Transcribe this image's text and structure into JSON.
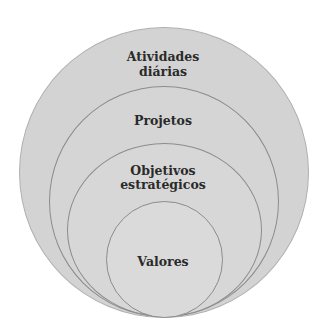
{
  "diagram": {
    "type": "nested-circles",
    "colors": {
      "fill": "#d4d4d4",
      "stroke": "#8c8c8c",
      "text": "#2a2a2a",
      "background": "#ffffff"
    },
    "layers": [
      {
        "line1": "Atividades",
        "line2": "diárias"
      },
      {
        "line1": "Projetos",
        "line2": ""
      },
      {
        "line1": "Objetivos",
        "line2": "estratégicos"
      },
      {
        "line1": "Valores",
        "line2": ""
      }
    ]
  }
}
